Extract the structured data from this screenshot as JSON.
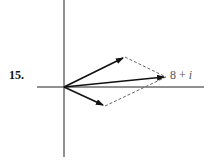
{
  "problem": {
    "number": "15."
  },
  "diagram": {
    "sum_label": {
      "real": "8 +",
      "imag": "i"
    },
    "origin": [
      64,
      87
    ],
    "vectors": [
      {
        "name": "vector-a",
        "tip": [
          125,
          57
        ]
      },
      {
        "name": "vector-b",
        "tip": [
          105,
          106
        ]
      },
      {
        "name": "vector-sum",
        "tip": [
          166,
          77
        ]
      }
    ],
    "colors": {
      "axis": "#222222",
      "vector": "#111111",
      "dashed": "#666666"
    }
  }
}
